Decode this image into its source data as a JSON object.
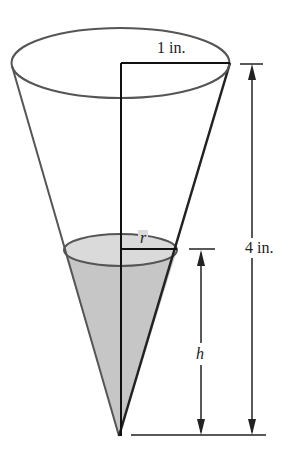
{
  "figure": {
    "labels": {
      "top_radius": "1 in.",
      "height": "4 in.",
      "water_radius": "r",
      "water_height": "h"
    },
    "colors": {
      "outline": "#444444",
      "water": "#c8c8c8",
      "water_surface": "#dcdcdc",
      "dimension": "#222222"
    }
  }
}
